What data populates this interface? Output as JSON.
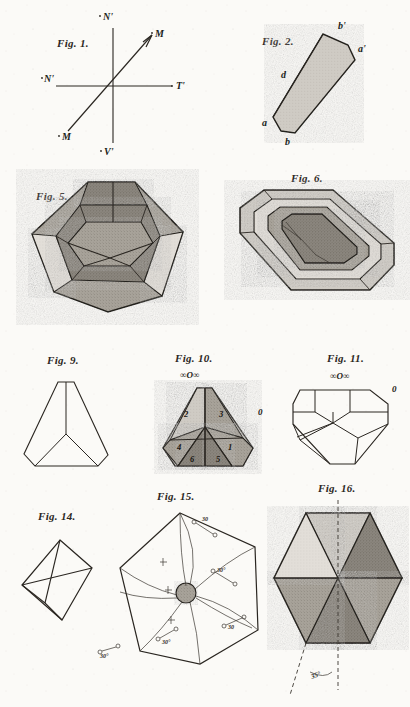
{
  "plate": {
    "title": "Crystallographic figure plate",
    "background_color": "#fbfaf7",
    "ink_color": "#2a2621"
  },
  "figures": [
    {
      "id": "fig1",
      "caption": "Fig. 1.",
      "type": "axis-diagram",
      "labels": [
        {
          "name": "axis-label-top",
          "text": "N'",
          "x": 110,
          "y": 18
        },
        {
          "name": "axis-label-right",
          "text": "T'",
          "x": 178,
          "y": 85
        },
        {
          "name": "axis-label-left",
          "text": "N'",
          "x": 46,
          "y": 78
        },
        {
          "name": "axis-label-bottom",
          "text": "V'",
          "x": 106,
          "y": 148
        },
        {
          "name": "axis-label-upper-right",
          "text": "M",
          "x": 152,
          "y": 38
        },
        {
          "name": "axis-label-lower-left",
          "text": "M",
          "x": 60,
          "y": 136
        }
      ]
    },
    {
      "id": "fig2",
      "caption": "Fig. 2.",
      "type": "crystal-prism",
      "labels": [
        {
          "name": "face-label-b-prime",
          "text": "b'",
          "x": 342,
          "y": 29
        },
        {
          "name": "face-label-a-prime",
          "text": "a'",
          "x": 360,
          "y": 52
        },
        {
          "name": "face-label-d",
          "text": "d",
          "x": 283,
          "y": 75
        },
        {
          "name": "face-label-a",
          "text": "a",
          "x": 265,
          "y": 125
        },
        {
          "name": "face-label-b",
          "text": "b",
          "x": 288,
          "y": 141
        }
      ]
    },
    {
      "id": "fig5",
      "caption": "Fig. 5.",
      "type": "truncated-triangular-crystal",
      "labels": []
    },
    {
      "id": "fig6",
      "caption": "Fig. 6.",
      "type": "rectangular-beveled-crystal",
      "labels": []
    },
    {
      "id": "fig9",
      "caption": "Fig. 9.",
      "type": "outline-triangular-form",
      "labels": []
    },
    {
      "id": "fig10",
      "caption": "Fig. 10.",
      "type": "sectored-triangular-crystal",
      "notation_top": "∞O∞",
      "notation_right": "0",
      "sectors": [
        {
          "name": "sector-2",
          "text": "2"
        },
        {
          "name": "sector-3",
          "text": "3"
        },
        {
          "name": "sector-4",
          "text": "4"
        },
        {
          "name": "sector-1",
          "text": "1"
        },
        {
          "name": "sector-6",
          "text": "6"
        },
        {
          "name": "sector-5",
          "text": "5"
        }
      ]
    },
    {
      "id": "fig11",
      "caption": "Fig. 11.",
      "type": "outline-faceted-polygon",
      "notation_top": "∞O∞",
      "notation_right": "0",
      "labels": []
    },
    {
      "id": "fig14",
      "caption": "Fig. 14.",
      "type": "octahedron-outline",
      "labels": []
    },
    {
      "id": "fig15",
      "caption": "Fig. 15.",
      "type": "hexagonal-etch-figure",
      "annotations": [
        {
          "name": "etch-annotation-top",
          "text": "30"
        },
        {
          "name": "etch-annotation-right",
          "text": "30°"
        },
        {
          "name": "etch-annotation-lower-right",
          "text": "30"
        },
        {
          "name": "etch-annotation-bottom",
          "text": "30°"
        },
        {
          "name": "etch-annotation-left",
          "text": "30°"
        }
      ]
    },
    {
      "id": "fig16",
      "caption": "Fig. 16.",
      "type": "sectored-hexagon",
      "angle_label": "35°"
    }
  ]
}
